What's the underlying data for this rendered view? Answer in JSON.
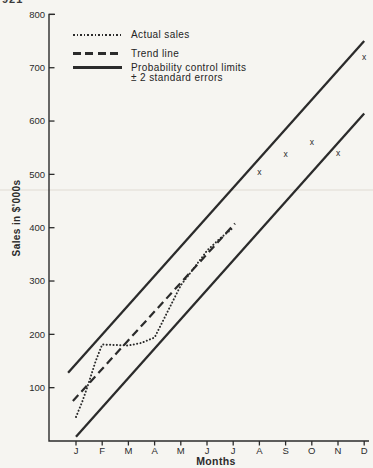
{
  "page_fragment": "921",
  "legend": {
    "items": [
      {
        "label": "Actual sales",
        "style": "dotted"
      },
      {
        "label": "Trend line",
        "style": "dashed"
      },
      {
        "label": "Probability control limits",
        "label2": "± 2 standard errors",
        "style": "solid"
      }
    ]
  },
  "chart_data": {
    "type": "line",
    "title": "",
    "xlabel": "Months",
    "ylabel": "Sales in $'000s",
    "x_categories": [
      "J",
      "F",
      "M",
      "A",
      "M",
      "J",
      "J",
      "A",
      "S",
      "O",
      "N",
      "D"
    ],
    "y_ticks": [
      800,
      700,
      600,
      500,
      400,
      300,
      200,
      100
    ],
    "ylim": [
      0,
      800
    ],
    "grid": false,
    "legend_position": "top-left",
    "series": [
      {
        "name": "Actual sales",
        "style": "dotted",
        "points": [
          [
            0,
            45
          ],
          [
            0.25,
            75
          ],
          [
            0.5,
            111
          ],
          [
            0.75,
            150
          ],
          [
            1,
            181
          ],
          [
            1.5,
            180
          ],
          [
            2,
            179
          ],
          [
            2.5,
            184
          ],
          [
            3,
            194
          ],
          [
            3.5,
            243
          ],
          [
            4,
            292
          ],
          [
            4.5,
            324
          ],
          [
            5,
            357
          ],
          [
            5.5,
            380
          ],
          [
            6,
            400
          ]
        ]
      },
      {
        "name": "Trend line",
        "style": "dashed",
        "points": [
          [
            -0.12,
            75
          ],
          [
            6.07,
            408
          ]
        ]
      },
      {
        "name": "Upper probability control limit (+2 SE)",
        "style": "solid",
        "points": [
          [
            -0.3,
            128
          ],
          [
            11,
            750
          ]
        ]
      },
      {
        "name": "Lower probability control limit (-2 SE)",
        "style": "solid",
        "points": [
          [
            0,
            8
          ],
          [
            11,
            614
          ]
        ]
      },
      {
        "name": "Actual sales (x marks, Aug-Dec)",
        "style": "x-marker",
        "marker": "x",
        "points": [
          [
            7,
            505
          ],
          [
            8,
            538
          ],
          [
            9,
            560
          ],
          [
            10,
            541
          ],
          [
            11,
            720
          ]
        ]
      }
    ]
  }
}
